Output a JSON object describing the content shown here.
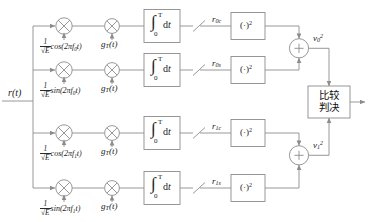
{
  "diagram": {
    "input": {
      "label": "r(t)"
    },
    "branches": [
      {
        "id": "branch-0c",
        "carrier_coef": "1",
        "carrier_den": "√E",
        "carrier_fn": "cos(2πf",
        "carrier_sub": "0",
        "carrier_tail": "t)",
        "pulse_label": "g",
        "pulse_sub": "T",
        "pulse_tail": "(t)",
        "integrator": {
          "integral": "∫",
          "upper": "T",
          "lower": "0",
          "operand": "dt"
        },
        "sampler": "sampling-switch",
        "out_label": "r",
        "out_sub": "0c",
        "square_label": "(·)",
        "square_sup": "2"
      },
      {
        "id": "branch-0s",
        "carrier_coef": "1",
        "carrier_den": "√E",
        "carrier_fn": "sin(2πf",
        "carrier_sub": "0",
        "carrier_tail": "t)",
        "pulse_label": "g",
        "pulse_sub": "T",
        "pulse_tail": "(t)",
        "integrator": {
          "integral": "∫",
          "upper": "T",
          "lower": "0",
          "operand": "dt"
        },
        "sampler": "sampling-switch",
        "out_label": "r",
        "out_sub": "0s",
        "square_label": "(·)",
        "square_sup": "2"
      },
      {
        "id": "branch-1c",
        "carrier_coef": "1",
        "carrier_den": "√E",
        "carrier_fn": "cos(2πf",
        "carrier_sub": "1",
        "carrier_tail": "t)",
        "pulse_label": "g",
        "pulse_sub": "T",
        "pulse_tail": "(t)",
        "integrator": {
          "integral": "∫",
          "upper": "T",
          "lower": "0",
          "operand": "dt"
        },
        "sampler": "sampling-switch",
        "out_label": "r",
        "out_sub": "1c",
        "square_label": "(·)",
        "square_sup": "2"
      },
      {
        "id": "branch-1s",
        "carrier_coef": "1",
        "carrier_den": "√E",
        "carrier_fn": "sin(2πf",
        "carrier_sub": "1",
        "carrier_tail": "t)",
        "pulse_label": "g",
        "pulse_sub": "T",
        "pulse_tail": "(t)",
        "integrator": {
          "integral": "∫",
          "upper": "T",
          "lower": "0",
          "operand": "dt"
        },
        "sampler": "sampling-switch",
        "out_label": "r",
        "out_sub": "1s",
        "square_label": "(·)",
        "square_sup": "2"
      }
    ],
    "summers": [
      {
        "id": "summer-0",
        "symbol": "+",
        "out_label": "v",
        "out_sub": "0",
        "out_sup": "2"
      },
      {
        "id": "summer-1",
        "symbol": "+",
        "out_label": "v",
        "out_sub": "1",
        "out_sup": "2"
      }
    ],
    "decision_block": {
      "line1": "比较",
      "line2": "判决"
    },
    "colors": {
      "line": "#8c8c8c",
      "block_border": "#9a9a9a",
      "text": "#1a1a1a",
      "background": "#ffffff"
    }
  }
}
